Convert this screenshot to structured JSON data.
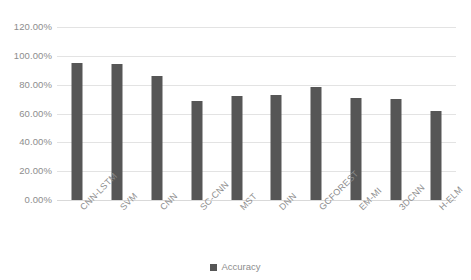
{
  "chart_data": {
    "type": "bar",
    "title": "",
    "xlabel": "",
    "ylabel": "",
    "categories": [
      "CNN-LSTM",
      "SVM",
      "CNN",
      "SC-CNN",
      "MST",
      "DNN",
      "GCFOREST",
      "EM-MI",
      "3DCNN",
      "H-ELM"
    ],
    "series": [
      {
        "name": "Accuracy",
        "values": [
          95,
          94,
          86,
          69,
          72,
          73,
          78.5,
          71,
          70,
          62
        ]
      }
    ],
    "ylim": [
      0,
      120
    ],
    "ytick_values": [
      0,
      20,
      40,
      60,
      80,
      100,
      120
    ],
    "ytick_labels": [
      "0.00%",
      "20.00%",
      "40.00%",
      "60.00%",
      "80.00%",
      "100.00%",
      "120.00%"
    ],
    "grid": true,
    "legend_position": "bottom",
    "bar_color": "#565656",
    "gridline_color": "#e3e3e3",
    "text_color": "#8d8d8d"
  },
  "legend": {
    "items": [
      {
        "label": "Accuracy",
        "color": "#565656",
        "marker": "square-marker"
      }
    ]
  }
}
